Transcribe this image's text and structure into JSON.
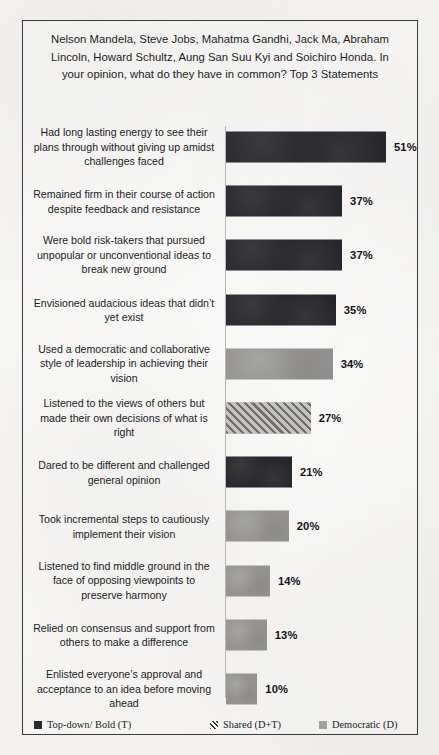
{
  "scan": {
    "top_cropped_text": "ㅤ"
  },
  "chart_title": "Nelson Mandela, Steve Jobs, Mahatma Gandhi, Jack Ma, Abraham Lincoln, Howard Schultz, Aung San Suu Kyi and Soichiro Honda. In your opinion, what do they have in common? Top 3 Statements",
  "legend": {
    "items": [
      {
        "label": "Top-down/ Bold (T)",
        "style": "topdown",
        "color": "#29282c"
      },
      {
        "label": "Shared (D+T)",
        "style": "shared",
        "color": "#6f6e6d"
      },
      {
        "label": "Democratic (D)",
        "style": "democratic",
        "color": "#a3a2a0"
      }
    ]
  },
  "chart_data": {
    "type": "bar",
    "orientation": "horizontal",
    "title": "Nelson Mandela, Steve Jobs, Mahatma Gandhi, Jack Ma, Abraham Lincoln, Howard Schultz, Aung San Suu Kyi and Soichiro Honda. In your opinion, what do they have in common? Top 3 Statements",
    "xlabel": "",
    "ylabel": "",
    "xlim": [
      0,
      51
    ],
    "grid": false,
    "legend_position": "bottom",
    "value_suffix": "%",
    "categories": [
      "Had long lasting energy to see their plans through without giving up amidst challenges faced",
      "Remained firm in their course of action despite feedback and resistance",
      "Were bold risk-takers that pursued unpopular or unconventional ideas to break new ground",
      "Envisioned audacious  ideas that didn’t yet exist",
      "Used a democratic and collaborative style of leadership  in achieving their vision",
      "Listened to the views of others but made their own decisions of what is right",
      "Dared to be different and challenged general opinion",
      "Took incremental steps to cautiously implement their vision",
      "Listened to find middle ground in the face of opposing viewpoints  to preserve harmony",
      "Relied on consensus and support from others to make a difference",
      "Enlisted everyone’s approval and acceptance to an idea before moving ahead"
    ],
    "values": [
      51,
      37,
      37,
      35,
      34,
      27,
      21,
      20,
      14,
      13,
      10
    ],
    "value_labels": [
      "51%",
      "37%",
      "37%",
      "35%",
      "34%",
      "27%",
      "21%",
      "20%",
      "14%",
      "13%",
      "10%"
    ],
    "series_style": [
      "topdown",
      "topdown",
      "topdown",
      "topdown",
      "democratic",
      "shared",
      "topdown",
      "democratic",
      "democratic",
      "democratic",
      "democratic"
    ],
    "series": [
      {
        "name": "Top-down/ Bold (T)",
        "values": [
          51,
          37,
          37,
          35,
          null,
          null,
          21,
          null,
          null,
          null,
          null
        ]
      },
      {
        "name": "Shared (D+T)",
        "values": [
          null,
          null,
          null,
          null,
          null,
          27,
          null,
          null,
          null,
          null,
          null
        ]
      },
      {
        "name": "Democratic (D)",
        "values": [
          null,
          null,
          null,
          null,
          34,
          null,
          null,
          20,
          14,
          13,
          10
        ]
      }
    ]
  },
  "bars": [
    {
      "label": "Had long lasting energy to see their plans through without giving up amidst challenges faced",
      "value": 51,
      "value_label": "51%",
      "style": "topdown"
    },
    {
      "label": "Remained firm in their course of action despite feedback and resistance",
      "value": 37,
      "value_label": "37%",
      "style": "topdown"
    },
    {
      "label": "Were bold risk-takers that pursued unpopular or unconventional ideas to break new ground",
      "value": 37,
      "value_label": "37%",
      "style": "topdown"
    },
    {
      "label": "Envisioned audacious  ideas that didn’t yet exist",
      "value": 35,
      "value_label": "35%",
      "style": "topdown"
    },
    {
      "label": "Used a democratic and collaborative style of leadership  in achieving their vision",
      "value": 34,
      "value_label": "34%",
      "style": "democratic"
    },
    {
      "label": "Listened to the views of others but made their own decisions of what is right",
      "value": 27,
      "value_label": "27%",
      "style": "shared"
    },
    {
      "label": "Dared to be different and challenged general opinion",
      "value": 21,
      "value_label": "21%",
      "style": "topdown"
    },
    {
      "label": "Took incremental steps to cautiously implement their vision",
      "value": 20,
      "value_label": "20%",
      "style": "democratic"
    },
    {
      "label": "Listened to find middle ground in the face of opposing viewpoints  to preserve harmony",
      "value": 14,
      "value_label": "14%",
      "style": "democratic"
    },
    {
      "label": "Relied on consensus and support from others to make a difference",
      "value": 13,
      "value_label": "13%",
      "style": "democratic"
    },
    {
      "label": "Enlisted everyone’s approval and acceptance to an idea before moving ahead",
      "value": 10,
      "value_label": "10%",
      "style": "democratic"
    }
  ]
}
